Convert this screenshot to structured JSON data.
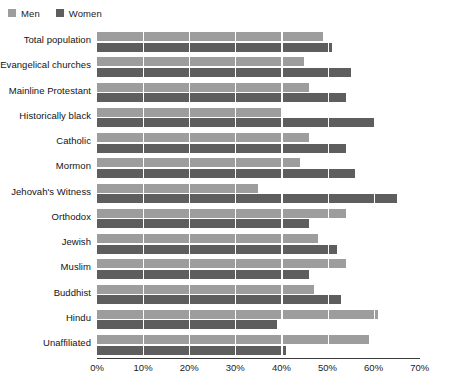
{
  "legend": {
    "items": [
      {
        "label": "Men",
        "color": "#9d9d9d",
        "icon": "square-swatch-icon"
      },
      {
        "label": "Women",
        "color": "#5e5e5e",
        "icon": "square-swatch-icon"
      }
    ]
  },
  "axis": {
    "ticks": [
      "0%",
      "10%",
      "20%",
      "30%",
      "40%",
      "50%",
      "60%",
      "70%"
    ],
    "tick_values": [
      0,
      10,
      20,
      30,
      40,
      50,
      60,
      70
    ]
  },
  "chart_data": {
    "type": "bar",
    "orientation": "horizontal",
    "title": "",
    "subtitle": "",
    "xlabel": "",
    "ylabel": "",
    "xlim": [
      0,
      70
    ],
    "grid": true,
    "legend_position": "top-left",
    "categories": [
      "Total population",
      "Evangelical churches",
      "Mainline Protestant",
      "Historically black",
      "Catholic",
      "Mormon",
      "Jehovah's Witness",
      "Orthodox",
      "Jewish",
      "Muslim",
      "Buddhist",
      "Hindu",
      "Unaffiliated"
    ],
    "series": [
      {
        "name": "Men",
        "color": "#9d9d9d",
        "values": [
          49,
          45,
          46,
          40,
          46,
          44,
          35,
          54,
          48,
          54,
          47,
          61,
          59
        ]
      },
      {
        "name": "Women",
        "color": "#5e5e5e",
        "values": [
          51,
          55,
          54,
          60,
          54,
          56,
          65,
          46,
          52,
          46,
          53,
          39,
          41
        ]
      }
    ]
  }
}
